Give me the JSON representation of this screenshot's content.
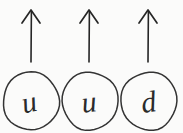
{
  "diagram": {
    "background_color": "#fbfbfa",
    "ink_color": "#2b2b2b",
    "canvas": {
      "width": 183,
      "height": 133
    },
    "particles": [
      {
        "label": "u",
        "name": "up-quark",
        "spin": "up",
        "arrow_symbol": "↑",
        "circle": {
          "cx": 31,
          "cy": 101,
          "rx": 28,
          "ry": 29
        },
        "arrow": {
          "x": 31,
          "tip_y": 10,
          "tail_y": 62,
          "head_half_width": 9,
          "head_height": 13
        },
        "glyph_x": 31,
        "glyph_y": 112,
        "glyph_size": 31,
        "glyph_slant": -12
      },
      {
        "label": "u",
        "name": "up-quark",
        "spin": "up",
        "arrow_symbol": "↑",
        "circle": {
          "cx": 90,
          "cy": 101,
          "rx": 28,
          "ry": 29
        },
        "arrow": {
          "x": 89,
          "tip_y": 10,
          "tail_y": 62,
          "head_half_width": 9,
          "head_height": 13
        },
        "glyph_x": 90,
        "glyph_y": 112,
        "glyph_size": 31,
        "glyph_slant": -6
      },
      {
        "label": "d",
        "name": "down-quark",
        "spin": "up",
        "arrow_symbol": "↑",
        "circle": {
          "cx": 149,
          "cy": 101,
          "rx": 28,
          "ry": 29
        },
        "arrow": {
          "x": 148,
          "tip_y": 10,
          "tail_y": 62,
          "head_half_width": 9,
          "head_height": 13
        },
        "glyph_x": 150,
        "glyph_y": 112,
        "glyph_size": 31,
        "glyph_slant": -8
      }
    ]
  }
}
